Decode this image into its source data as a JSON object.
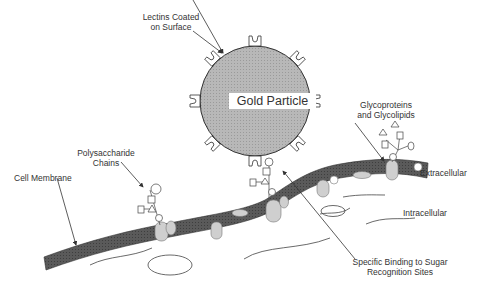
{
  "diagram": {
    "type": "schematic",
    "colors": {
      "membrane": "#555555",
      "gold_particle": "#b3b3b3",
      "protein": "#cccccc",
      "line": "#333333",
      "background": "#ffffff"
    },
    "labels": {
      "lectins": [
        "Lectins Coated",
        "on Surface"
      ],
      "gold_particle": "Gold Particle",
      "glycoproteins": [
        "Glycoproteins",
        "and Glycolipids"
      ],
      "polysaccharide": [
        "Polysaccharide",
        "Chains"
      ],
      "cell_membrane": "Cell Membrane",
      "extracellular": "Extracellular",
      "intracellular": "Intracellular",
      "binding": [
        "Specific Binding to Sugar",
        "Recognition Sites"
      ]
    },
    "nodes": [
      {
        "id": "gold-particle",
        "label": "Gold Particle",
        "shape": "circle"
      },
      {
        "id": "lectins",
        "label": "Lectins Coated on Surface"
      },
      {
        "id": "polysaccharide-chains",
        "label": "Polysaccharide Chains"
      },
      {
        "id": "glycoproteins",
        "label": "Glycoproteins and Glycolipids"
      },
      {
        "id": "cell-membrane",
        "label": "Cell Membrane"
      },
      {
        "id": "binding-sites",
        "label": "Specific Binding to Sugar Recognition Sites"
      }
    ]
  }
}
